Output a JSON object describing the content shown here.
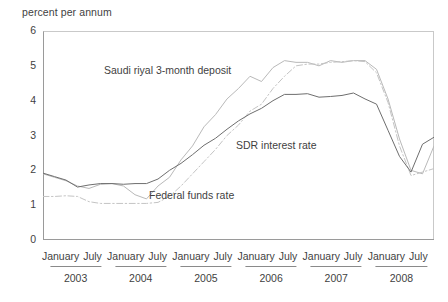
{
  "chart_data": {
    "type": "line",
    "title": "",
    "ylabel": "percent per annum",
    "xlabel": "",
    "ylim": [
      0,
      6
    ],
    "yticks": [
      0,
      1,
      2,
      3,
      4,
      5,
      6
    ],
    "grid": false,
    "legend_position": "inline-annotations",
    "x_tick_labels": [
      "January",
      "July",
      "January",
      "July",
      "January",
      "July",
      "January",
      "July",
      "January",
      "July",
      "January",
      "July"
    ],
    "x_group_labels": [
      "2003",
      "2004",
      "2005",
      "2006",
      "2007",
      "2008"
    ],
    "x": [
      "2003-01",
      "2003-03",
      "2003-05",
      "2003-07",
      "2003-09",
      "2003-11",
      "2004-01",
      "2004-03",
      "2004-05",
      "2004-07",
      "2004-09",
      "2004-11",
      "2005-01",
      "2005-03",
      "2005-05",
      "2005-07",
      "2005-09",
      "2005-11",
      "2006-01",
      "2006-03",
      "2006-05",
      "2006-07",
      "2006-09",
      "2006-11",
      "2007-01",
      "2007-03",
      "2007-05",
      "2007-07",
      "2007-09",
      "2007-11",
      "2008-01",
      "2008-03",
      "2008-05",
      "2008-07",
      "2008-09"
    ],
    "series": [
      {
        "name": "Saudi riyal 3-month deposit",
        "color": "#b9b9b9",
        "style": "solid",
        "values": [
          1.9,
          1.8,
          1.7,
          1.55,
          1.48,
          1.6,
          1.62,
          1.55,
          1.3,
          1.18,
          1.55,
          1.8,
          2.3,
          2.7,
          3.25,
          3.6,
          4.05,
          4.35,
          4.7,
          4.55,
          4.95,
          5.15,
          5.1,
          5.1,
          5.0,
          5.15,
          5.1,
          5.15,
          5.15,
          4.9,
          4.05,
          2.9,
          2.0,
          1.9,
          2.7
        ]
      },
      {
        "name": "SDR interest rate",
        "color": "#c4c4c4",
        "style": "dash-dot",
        "values": [
          1.25,
          1.25,
          1.27,
          1.25,
          1.1,
          1.05,
          1.05,
          1.05,
          1.05,
          1.05,
          1.08,
          1.25,
          1.55,
          1.9,
          2.25,
          2.6,
          3.0,
          3.3,
          3.7,
          3.9,
          4.35,
          4.7,
          5.0,
          5.05,
          5.05,
          5.1,
          5.12,
          5.15,
          5.12,
          4.8,
          3.95,
          2.7,
          1.85,
          1.95,
          2.05
        ]
      },
      {
        "name": "Federal funds rate",
        "color": "#6e6e6e",
        "style": "solid",
        "values": [
          1.92,
          1.82,
          1.72,
          1.52,
          1.58,
          1.62,
          1.62,
          1.6,
          1.62,
          1.62,
          1.75,
          2.0,
          2.2,
          2.45,
          2.72,
          2.92,
          3.18,
          3.42,
          3.62,
          3.78,
          4.0,
          4.18,
          4.18,
          4.2,
          4.1,
          4.12,
          4.15,
          4.22,
          4.05,
          3.9,
          3.15,
          2.4,
          1.95,
          2.75,
          2.95
        ]
      }
    ]
  }
}
